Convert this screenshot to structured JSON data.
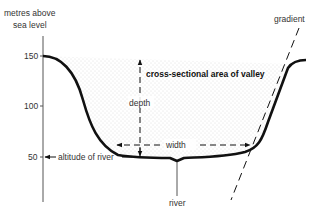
{
  "diagram": {
    "axis": {
      "label_line1": "metres above",
      "label_line2": "sea level",
      "ticks": [
        {
          "value": "150",
          "y": 56
        },
        {
          "value": "100",
          "y": 106
        },
        {
          "value": "50",
          "y": 157
        }
      ]
    },
    "labels": {
      "area": "cross-sectional area of valley",
      "depth": "depth",
      "width": "width",
      "altitude": "altitude of river",
      "river": "river",
      "gradient": "gradient"
    },
    "colors": {
      "outline": "#111111",
      "axis": "#555555",
      "stipple": "#bbbbbb",
      "text": "#333333"
    }
  }
}
